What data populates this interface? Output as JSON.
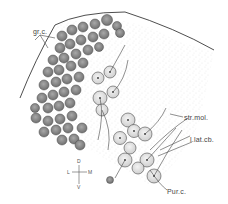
{
  "figure": {
    "type": "histological line drawing",
    "colors": {
      "ink": "#3a3a3a",
      "cell_fill": "#8c8c8c",
      "purkinje_fill": "#e6e6e6",
      "stipple": "#9a9a9a",
      "background": "#ffffff"
    }
  },
  "labels": {
    "granule_cells": "gr.c.",
    "stratum_moleculare": "str.mol.",
    "lateral_cerebellar_lobe": "l.lat.cb.",
    "purkinje_cells": "Pur.c."
  },
  "compass": {
    "dorsal": "D",
    "ventral": "V",
    "lateral": "L",
    "medial": "M"
  }
}
